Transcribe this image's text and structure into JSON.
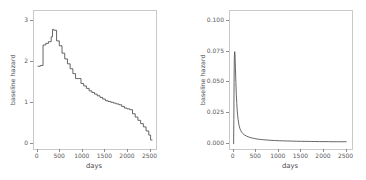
{
  "figure": {
    "background": "#ffffff",
    "line_color": "#555555",
    "panel_border_color": "#c9c9c9"
  },
  "chart_data": [
    {
      "type": "line",
      "panel": "left",
      "title": "",
      "xlabel": "days",
      "ylabel": "baseline hazard",
      "xlim": [
        -80,
        2620
      ],
      "ylim": [
        -0.12,
        3.25
      ],
      "xticks": [
        0,
        500,
        1000,
        1500,
        2000,
        2500
      ],
      "xticklabels": [
        "0",
        "500",
        "1000",
        "1500",
        "2000",
        "2500"
      ],
      "yticks": [
        0,
        1,
        2,
        3
      ],
      "yticklabels": [
        "0",
        "1",
        "2",
        "3"
      ],
      "grid": false,
      "legend": null,
      "step": true,
      "x": [
        0,
        60,
        120,
        180,
        240,
        300,
        330,
        360,
        420,
        480,
        540,
        600,
        660,
        720,
        780,
        840,
        900,
        960,
        1020,
        1080,
        1140,
        1200,
        1260,
        1320,
        1380,
        1440,
        1500,
        1560,
        1620,
        1680,
        1740,
        1800,
        1860,
        1920,
        1980,
        2040,
        2100,
        2160,
        2220,
        2280,
        2340,
        2400,
        2460,
        2500
      ],
      "values": [
        1.9,
        1.92,
        2.42,
        2.46,
        2.5,
        2.62,
        2.8,
        2.78,
        2.52,
        2.4,
        2.22,
        2.08,
        1.96,
        1.84,
        1.72,
        1.6,
        1.6,
        1.48,
        1.42,
        1.36,
        1.3,
        1.26,
        1.22,
        1.18,
        1.14,
        1.1,
        1.06,
        1.04,
        1.02,
        1.0,
        0.98,
        0.96,
        0.92,
        0.88,
        0.86,
        0.84,
        0.74,
        0.66,
        0.58,
        0.5,
        0.42,
        0.32,
        0.22,
        0.1
      ]
    },
    {
      "type": "line",
      "panel": "right",
      "title": "",
      "xlabel": "days",
      "ylabel": "baseline hazard",
      "xlim": [
        -80,
        2620
      ],
      "ylim": [
        -0.004,
        0.108
      ],
      "xticks": [
        0,
        500,
        1000,
        1500,
        2000,
        2500
      ],
      "xticklabels": [
        "0",
        "500",
        "1000",
        "1500",
        "2000",
        "2500"
      ],
      "yticks": [
        0.0,
        0.025,
        0.05,
        0.075,
        0.1
      ],
      "yticklabels": [
        "0.000",
        "0.025",
        "0.050",
        "0.075",
        "0.100"
      ],
      "grid": false,
      "legend": null,
      "step": false,
      "x": [
        0,
        5,
        10,
        15,
        20,
        25,
        30,
        40,
        50,
        60,
        70,
        80,
        90,
        100,
        120,
        140,
        160,
        180,
        200,
        240,
        280,
        320,
        360,
        400,
        460,
        520,
        580,
        640,
        700,
        800,
        900,
        1000,
        1100,
        1200,
        1300,
        1400,
        1500,
        1600,
        1700,
        1800,
        1900,
        2000,
        2100,
        2200,
        2300,
        2400,
        2500
      ],
      "values": [
        0.0,
        0.02,
        0.05,
        0.068,
        0.074,
        0.075,
        0.073,
        0.062,
        0.05,
        0.04,
        0.033,
        0.027,
        0.023,
        0.02,
        0.015,
        0.0125,
        0.0108,
        0.0096,
        0.0087,
        0.0074,
        0.0066,
        0.0059,
        0.0054,
        0.005,
        0.0045,
        0.0041,
        0.0038,
        0.0036,
        0.0034,
        0.0031,
        0.0029,
        0.0027,
        0.0026,
        0.0025,
        0.0024,
        0.0023,
        0.0022,
        0.0022,
        0.0021,
        0.0021,
        0.002,
        0.002,
        0.002,
        0.0019,
        0.0019,
        0.0019,
        0.0019
      ]
    }
  ]
}
